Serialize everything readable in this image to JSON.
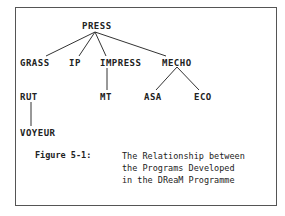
{
  "diagram": {
    "type": "tree",
    "nodes": {
      "press": "PRESS",
      "grass": "GRASS",
      "ip": "IP",
      "impress": "IMPRESS",
      "mecho": "MECHO",
      "rut": "RUT",
      "mt": "MT",
      "asa": "ASA",
      "eco": "ECO",
      "voyeur": "VOYEUR"
    },
    "edges": [
      [
        "PRESS",
        "GRASS"
      ],
      [
        "PRESS",
        "IP"
      ],
      [
        "PRESS",
        "IMPRESS"
      ],
      [
        "PRESS",
        "MECHO"
      ],
      [
        "GRASS",
        "RUT"
      ],
      [
        "IMPRESS",
        "MT"
      ],
      [
        "MECHO",
        "ASA"
      ],
      [
        "MECHO",
        "ECO"
      ],
      [
        "RUT",
        "VOYEUR"
      ]
    ]
  },
  "caption": {
    "label": "Figure 5-1:",
    "lines": [
      "The Relationship between",
      "the Programs Developed",
      "in the DReaM Programme"
    ]
  }
}
